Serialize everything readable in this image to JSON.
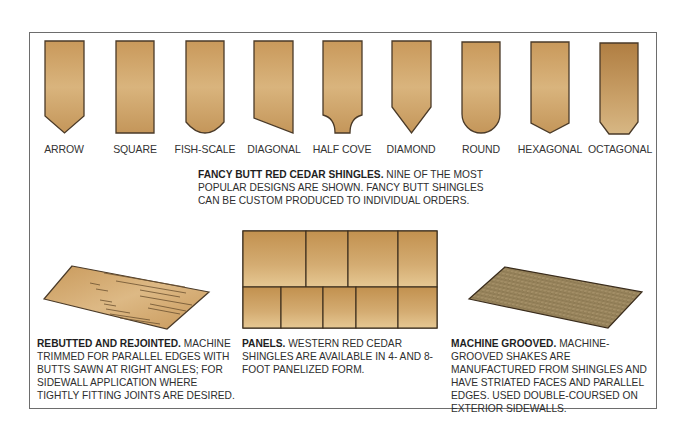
{
  "figure": {
    "shingle_shapes": [
      {
        "name": "ARROW"
      },
      {
        "name": "SQUARE"
      },
      {
        "name": "FISH-SCALE"
      },
      {
        "name": "DIAGONAL"
      },
      {
        "name": "HALF COVE"
      },
      {
        "name": "DIAMOND"
      },
      {
        "name": "ROUND"
      },
      {
        "name": "HEXAGONAL"
      },
      {
        "name": "OCTAGONAL"
      }
    ],
    "fancy_butt_caption": {
      "title": "FANCY BUTT RED CEDAR SHINGLES.",
      "body": "NINE OF THE MOST POPULAR DESIGNS ARE SHOWN. FANCY BUTT SHINGLES CAN BE CUSTOM PRODUCED TO INDIVIDUAL ORDERS."
    },
    "rebutted": {
      "title": "REBUTTED AND REJOINTED.",
      "body": "MACHINE TRIMMED FOR PARALLEL EDGES WITH BUTTS SAWN AT RIGHT ANGLES; FOR SIDEWALL APPLICATION WHERE TIGHTLY FITTING JOINTS ARE DESIRED."
    },
    "panels": {
      "title": "PANELS.",
      "body": "WESTERN RED CEDAR SHINGLES ARE AVAILABLE IN 4- AND 8-FOOT PANELIZED FORM."
    },
    "machine_grooved": {
      "title": "MACHINE GROOVED.",
      "body": "MACHINE-GROOVED SHAKES ARE MANUFACTURED FROM SHINGLES AND HAVE STRIATED FACES AND PARALLEL EDGES. USED DOUBLE-COURSED ON EXTERIOR SIDEWALLS."
    },
    "colors": {
      "wood_light": "#e2bf88",
      "wood_mid": "#c99a5c",
      "wood_dark": "#a87a42",
      "outline": "#4a3a28",
      "grooved": "#9a8660",
      "frame": "#6d6d6d"
    }
  }
}
